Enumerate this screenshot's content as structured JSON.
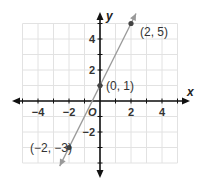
{
  "chart_data": {
    "type": "line",
    "title": "",
    "xlabel": "x",
    "ylabel": "y",
    "origin_label": "O",
    "xlim": [
      -5,
      5
    ],
    "ylim": [
      -4,
      5
    ],
    "grid": true,
    "x_ticks": [
      -4,
      -2,
      2,
      4
    ],
    "y_ticks": [
      4,
      2,
      -2
    ],
    "x_tick_labels": [
      "−4",
      "−2",
      "2",
      "4"
    ],
    "y_tick_labels": [
      "4",
      "2",
      "−2"
    ],
    "line": {
      "slope": 2,
      "intercept": 1,
      "color": "#999999",
      "arrows": "both"
    },
    "points": [
      {
        "x": -2,
        "y": -3,
        "label": "(−2, −3)"
      },
      {
        "x": 0,
        "y": 1,
        "label": "(0, 1)"
      },
      {
        "x": 2,
        "y": 5,
        "label": "(2, 5)"
      }
    ]
  }
}
